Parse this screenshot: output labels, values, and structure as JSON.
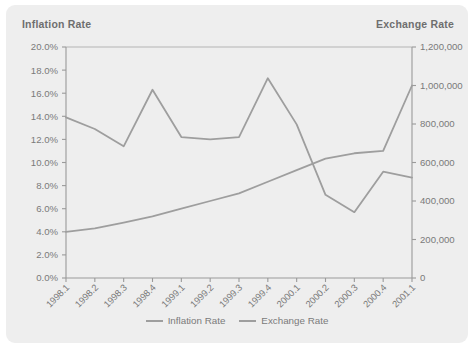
{
  "panel": {
    "background_color": "#eeeeee",
    "line_color": "#9e9e9e",
    "text_color": "#7a7a7a"
  },
  "left_axis_title": "Inflation Rate",
  "right_axis_title": "Exchange Rate",
  "legend": {
    "entries": [
      {
        "label": "Inflation Rate",
        "color": "#9e9e9e"
      },
      {
        "label": "Exchange Rate",
        "color": "#9e9e9e"
      }
    ]
  },
  "chart_data": {
    "type": "line",
    "title": "",
    "xlabel": "",
    "grid": false,
    "legend_position": "bottom",
    "categories": [
      "1998.1",
      "1998.2",
      "1998.3",
      "1998.4",
      "1999.1",
      "1999.2",
      "1999.3",
      "1999.4",
      "2000.1",
      "2000.2",
      "2000.3",
      "2000.4",
      "2001.1"
    ],
    "series": [
      {
        "name": "Inflation Rate",
        "axis": "left",
        "ylabel": "Inflation Rate",
        "ylim": [
          0.0,
          20.0
        ],
        "yticks": [
          "0.0%",
          "2.0%",
          "4.0%",
          "6.0%",
          "8.0%",
          "10.0%",
          "12.0%",
          "14.0%",
          "16.0%",
          "18.0%",
          "20.0%"
        ],
        "values": [
          13.9,
          12.9,
          11.4,
          16.3,
          12.2,
          12.0,
          12.2,
          17.3,
          13.3,
          7.2,
          5.7,
          9.2,
          8.7
        ]
      },
      {
        "name": "Exchange Rate",
        "axis": "right",
        "ylabel": "Exchange Rate",
        "ylim": [
          0,
          1200000
        ],
        "yticks": [
          "0",
          "200,000",
          "400,000",
          "600,000",
          "800,000",
          "1,000,000",
          "1,200,000"
        ],
        "values": [
          240000,
          258000,
          288000,
          320000,
          360000,
          400000,
          440000,
          500000,
          560000,
          620000,
          648000,
          660000,
          1000000
        ]
      }
    ]
  }
}
